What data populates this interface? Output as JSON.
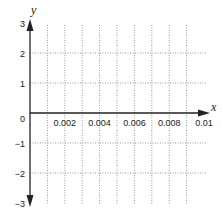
{
  "chart_data": {
    "type": "line",
    "title": "",
    "xlabel": "x",
    "ylabel": "y",
    "xlim": [
      0,
      0.01
    ],
    "ylim": [
      -3,
      3
    ],
    "grid": true,
    "grid_style": "dotted",
    "x_grid_step": 0.001,
    "y_grid_step": 1,
    "x_tick_labels": [
      "0.002",
      "0.004",
      "0.006",
      "0.008",
      "0.01"
    ],
    "x_tick_values": [
      0.002,
      0.004,
      0.006,
      0.008,
      0.01
    ],
    "y_tick_labels": [
      "3",
      "2",
      "1",
      "0",
      "−1",
      "−2",
      "−3"
    ],
    "y_tick_values": [
      3,
      2,
      1,
      0,
      -1,
      -2,
      -3
    ],
    "series": [],
    "legend": null,
    "colors": {
      "axis": "#222222",
      "grid": "#9a9a9a",
      "text": "#222222",
      "background": "#ffffff"
    }
  }
}
